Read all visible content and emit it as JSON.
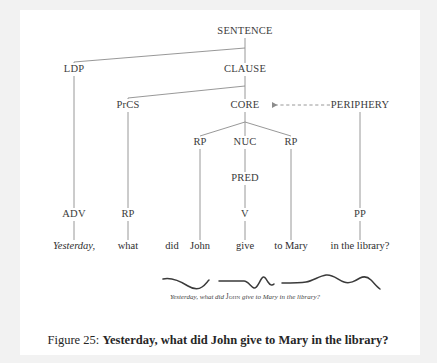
{
  "figure": {
    "caption_prefix": "Figure 25:",
    "caption_title": "Yesterday, what did John give to Mary in the library?"
  },
  "colors": {
    "page_background": "#f2f2f2",
    "paper": "#ffffff",
    "line": "#8c8c8c",
    "node_text": "#3b3b3b",
    "word_text": "#2e2e2e",
    "caption_text": "#262626",
    "prosody_line": "#3a3a3a"
  },
  "tree": {
    "nodes": [
      {
        "id": "sentence",
        "label": "SENTENCE",
        "x": 245,
        "y": 31
      },
      {
        "id": "ldp",
        "label": "LDP",
        "x": 74,
        "y": 69
      },
      {
        "id": "clause",
        "label": "CLAUSE",
        "x": 245,
        "y": 69
      },
      {
        "id": "prcs",
        "label": "PrCS",
        "x": 128,
        "y": 105
      },
      {
        "id": "core",
        "label": "CORE",
        "x": 245,
        "y": 105
      },
      {
        "id": "periphery",
        "label": "PERIPHERY",
        "x": 360,
        "y": 105
      },
      {
        "id": "rp-left",
        "label": "RP",
        "x": 200,
        "y": 142
      },
      {
        "id": "nuc",
        "label": "NUC",
        "x": 245,
        "y": 142
      },
      {
        "id": "rp-right",
        "label": "RP",
        "x": 291,
        "y": 142
      },
      {
        "id": "pred",
        "label": "PRED",
        "x": 245,
        "y": 178
      },
      {
        "id": "adv",
        "label": "ADV",
        "x": 74,
        "y": 214
      },
      {
        "id": "rp-prcs",
        "label": "RP",
        "x": 128,
        "y": 214
      },
      {
        "id": "v",
        "label": "V",
        "x": 245,
        "y": 214
      },
      {
        "id": "pp",
        "label": "PP",
        "x": 360,
        "y": 214
      }
    ],
    "words": [
      {
        "id": "word-yesterday",
        "text": "Yesterday,",
        "x": 74,
        "y": 246,
        "italic": true
      },
      {
        "id": "word-what",
        "text": "what",
        "x": 128,
        "y": 246,
        "italic": false
      },
      {
        "id": "word-did",
        "text": "did",
        "x": 172,
        "y": 246,
        "italic": false
      },
      {
        "id": "word-john",
        "text": "John",
        "x": 200,
        "y": 246,
        "italic": false
      },
      {
        "id": "word-give",
        "text": "give",
        "x": 245,
        "y": 246,
        "italic": false
      },
      {
        "id": "word-to-mary",
        "text": "to Mary",
        "x": 291,
        "y": 246,
        "italic": false
      },
      {
        "id": "word-in-the-library",
        "text": "in the library?",
        "x": 360,
        "y": 246,
        "italic": false
      }
    ],
    "relation_arrow": {
      "from": "PERIPHERY",
      "to": "CORE",
      "style": "dashed",
      "direction": "left"
    }
  },
  "prosody": {
    "transcript_pre": "Yesterday, what did ",
    "transcript_smallcaps": "John",
    "transcript_post": " give to Mary in the library?",
    "contour_segments": 3
  }
}
